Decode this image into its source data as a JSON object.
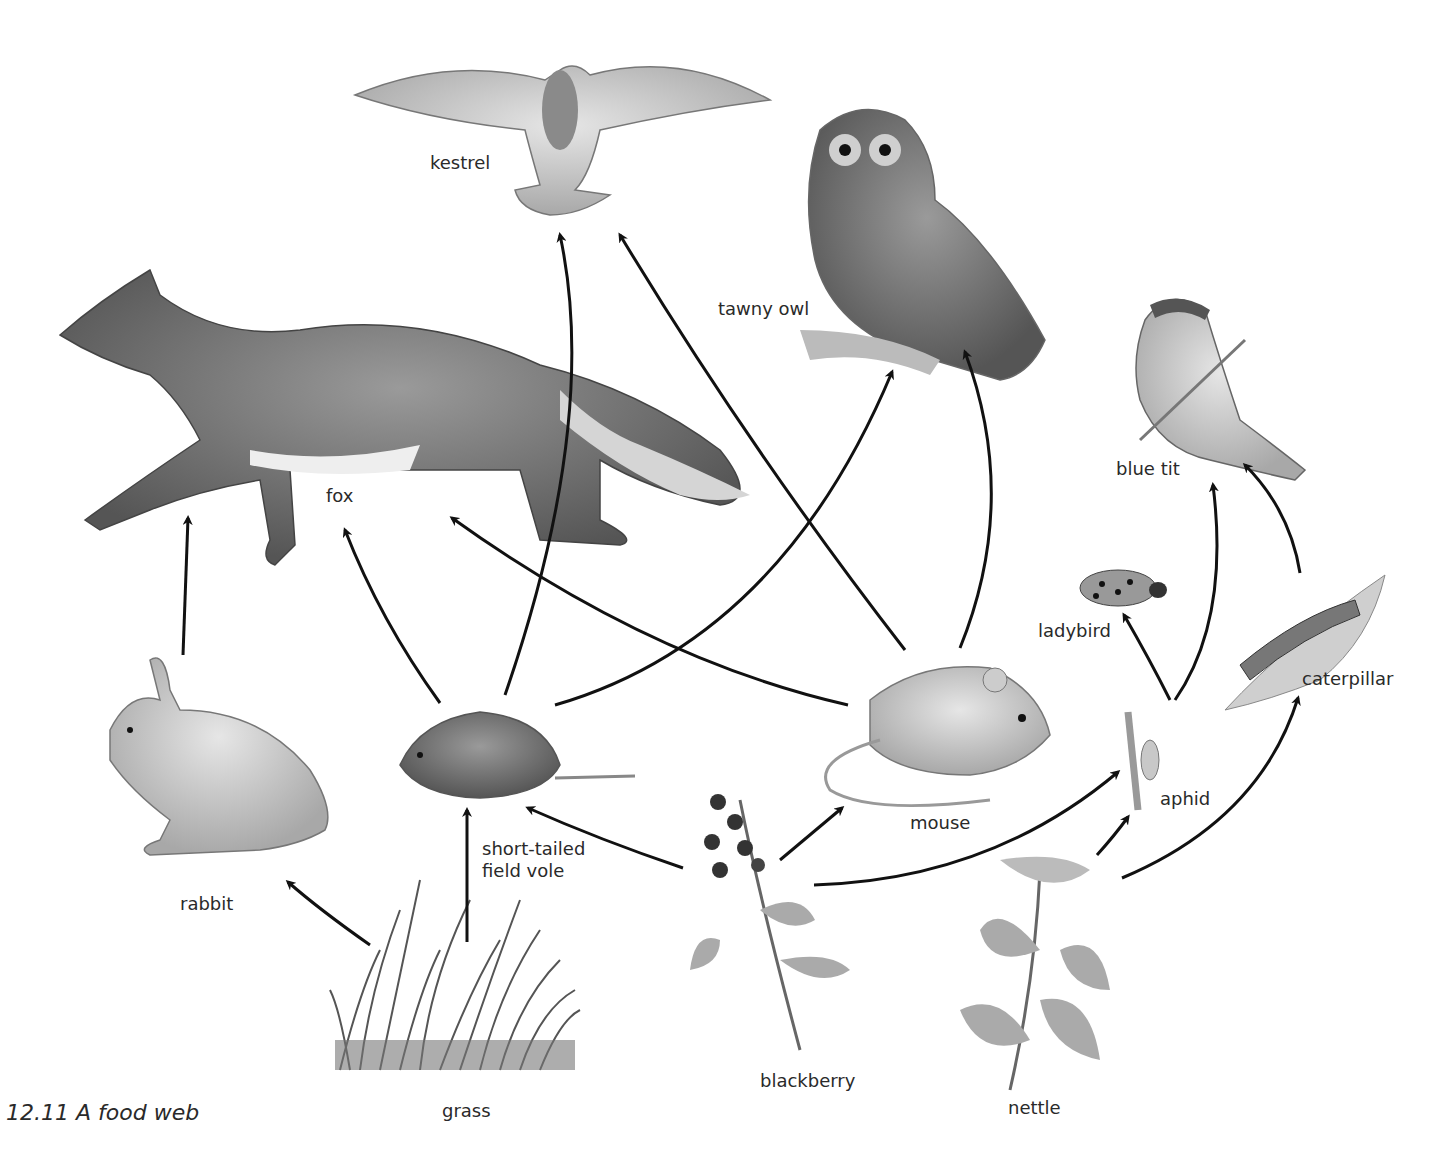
{
  "caption": "12.11  A food web",
  "organisms": {
    "kestrel": {
      "label": "kestrel",
      "x": 430,
      "y": 152
    },
    "tawny_owl": {
      "label": "tawny owl",
      "x": 718,
      "y": 298
    },
    "fox": {
      "label": "fox",
      "x": 326,
      "y": 485
    },
    "blue_tit": {
      "label": "blue tit",
      "x": 1116,
      "y": 458
    },
    "ladybird": {
      "label": "ladybird",
      "x": 1038,
      "y": 620
    },
    "caterpillar": {
      "label": "caterpillar",
      "x": 1302,
      "y": 668
    },
    "rabbit": {
      "label": "rabbit",
      "x": 180,
      "y": 893
    },
    "vole": {
      "label": "short-tailed\nfield vole",
      "x": 482,
      "y": 838
    },
    "mouse": {
      "label": "mouse",
      "x": 910,
      "y": 812
    },
    "aphid": {
      "label": "aphid",
      "x": 1160,
      "y": 788
    },
    "grass": {
      "label": "grass",
      "x": 442,
      "y": 1100
    },
    "blackberry": {
      "label": "blackberry",
      "x": 760,
      "y": 1070
    },
    "nettle": {
      "label": "nettle",
      "x": 1008,
      "y": 1097
    }
  },
  "links": [
    {
      "from": "grass",
      "to": "rabbit"
    },
    {
      "from": "grass",
      "to": "short-tailed field vole"
    },
    {
      "from": "blackberry",
      "to": "short-tailed field vole"
    },
    {
      "from": "blackberry",
      "to": "mouse"
    },
    {
      "from": "blackberry",
      "to": "aphid"
    },
    {
      "from": "nettle",
      "to": "aphid"
    },
    {
      "from": "nettle",
      "to": "caterpillar"
    },
    {
      "from": "rabbit",
      "to": "fox"
    },
    {
      "from": "short-tailed field vole",
      "to": "fox"
    },
    {
      "from": "short-tailed field vole",
      "to": "kestrel"
    },
    {
      "from": "short-tailed field vole",
      "to": "tawny owl"
    },
    {
      "from": "mouse",
      "to": "fox"
    },
    {
      "from": "mouse",
      "to": "kestrel"
    },
    {
      "from": "mouse",
      "to": "tawny owl"
    },
    {
      "from": "aphid",
      "to": "ladybird"
    },
    {
      "from": "aphid",
      "to": "blue tit"
    },
    {
      "from": "caterpillar",
      "to": "blue tit"
    }
  ],
  "colors": {
    "ink": "#111111",
    "text": "#2a2a2a",
    "sketch": "#8a8a8a",
    "sketch_dark": "#555555"
  }
}
